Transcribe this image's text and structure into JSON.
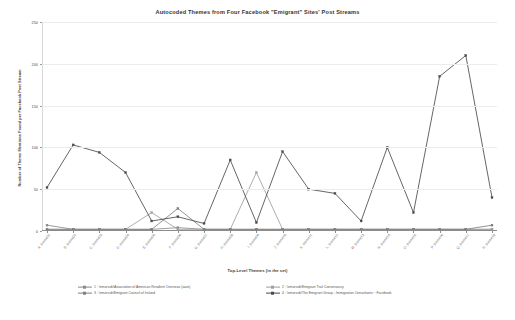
{
  "chart_data": {
    "type": "line",
    "title": "Autocoded Themes from Four Facebook \"Emigrant\" Sites' Post Streams",
    "xlabel": "Top-Level Themes (in the set)",
    "ylabel": "Number of Theme Mentions Found per Facebook Post Stream",
    "ylim": [
      0,
      250
    ],
    "yticks": [
      0,
      50,
      100,
      150,
      200,
      250
    ],
    "ytick_labels": [
      "0",
      "50",
      "100",
      "150",
      "200",
      "250"
    ],
    "grid": true,
    "legend_position": "bottom",
    "categories": [
      "A. theme01",
      "B. theme02",
      "C. theme03",
      "D. theme04",
      "E. theme05",
      "F. theme06",
      "G. theme07",
      "H. theme08",
      "I. theme09",
      "J. theme10",
      "K. theme11",
      "L. theme12",
      "M. theme13",
      "N. theme14",
      "O. theme15",
      "P. theme16",
      "Q. theme17",
      "R. theme18"
    ],
    "series": [
      {
        "name": "1 : \\emorsub\\Association of American Resident Overseas (aaro)",
        "color": "#8a8a8a",
        "values": [
          7,
          2,
          2,
          2,
          2,
          4,
          2,
          2,
          2,
          2,
          2,
          2,
          2,
          2,
          2,
          2,
          2,
          2
        ]
      },
      {
        "name": "2 : \\emorsub\\Emigrant Trail Conservancy",
        "color": "#9e9e9e",
        "values": [
          2,
          2,
          2,
          2,
          22,
          2,
          2,
          2,
          70,
          2,
          2,
          2,
          2,
          2,
          2,
          2,
          2,
          2
        ]
      },
      {
        "name": "3 : \\emorsub\\Emigrant Council of Ireland",
        "color": "#7f7f7f",
        "values": [
          2,
          2,
          2,
          2,
          2,
          27,
          2,
          2,
          2,
          2,
          2,
          2,
          2,
          2,
          2,
          2,
          2,
          7
        ]
      },
      {
        "name": "4 : \\emorsub\\The Emigrant Group - Immigration Consultants ~ Facebook",
        "color": "#4a4a4a",
        "values": [
          52,
          103,
          94,
          70,
          12,
          17,
          9,
          85,
          10,
          95,
          50,
          45,
          12,
          100,
          22,
          185,
          210,
          40
        ]
      }
    ]
  }
}
